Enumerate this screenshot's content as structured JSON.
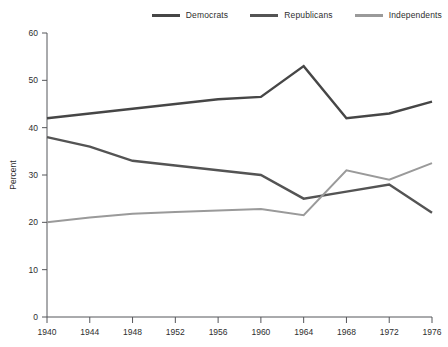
{
  "chart_data": {
    "type": "line",
    "title": "",
    "subtitle": "",
    "xlabel": "",
    "ylabel": "Percent",
    "x": [
      1940,
      1944,
      1948,
      1952,
      1956,
      1960,
      1964,
      1968,
      1972,
      1976
    ],
    "xtick_labels": [
      "1940",
      "1944",
      "1948",
      "1952",
      "1956",
      "1960",
      "1964",
      "1968",
      "1972",
      "1976"
    ],
    "ytick_labels": [
      "0",
      "10",
      "20",
      "30",
      "40",
      "50",
      "60"
    ],
    "yticks": [
      0,
      10,
      20,
      30,
      40,
      50,
      60
    ],
    "xlim": [
      1940,
      1976
    ],
    "ylim": [
      0,
      60
    ],
    "grid": false,
    "legend_position": "top-right",
    "series": [
      {
        "name": "Democrats",
        "color": "#464646",
        "values": [
          42.0,
          43.0,
          44.0,
          45.0,
          46.0,
          46.5,
          53.0,
          42.0,
          43.0,
          45.5
        ]
      },
      {
        "name": "Republicans",
        "color": "#545454",
        "values": [
          38.0,
          36.0,
          33.0,
          32.0,
          31.0,
          30.0,
          25.0,
          26.5,
          28.0,
          22.0
        ]
      },
      {
        "name": "Independents",
        "color": "#9a9a9a",
        "values": [
          20.0,
          21.0,
          21.8,
          22.2,
          22.5,
          22.8,
          21.5,
          31.0,
          29.0,
          32.5
        ]
      }
    ]
  },
  "legend": {
    "items": [
      {
        "label": "Democrats"
      },
      {
        "label": "Republicans"
      },
      {
        "label": "Independents"
      }
    ]
  }
}
